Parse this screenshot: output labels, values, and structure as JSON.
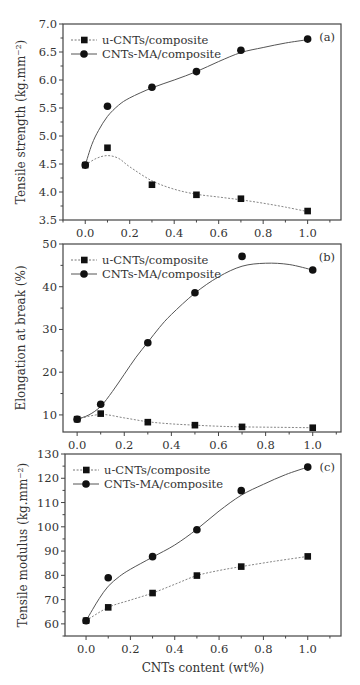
{
  "figure": {
    "width": 360,
    "height": 685
  },
  "chart_data": [
    {
      "type": "line",
      "panel_label": "(a)",
      "title": "",
      "xlabel": "",
      "ylabel": "Tensile strength (kg.mm⁻²)",
      "xlim": [
        -0.1,
        1.15
      ],
      "ylim": [
        3.5,
        7.0
      ],
      "xticks": [
        0.0,
        0.2,
        0.4,
        0.6,
        0.8,
        1.0
      ],
      "xtick_labels": [
        "0.0",
        "0.2",
        "0.4",
        "0.6",
        "0.8",
        "1.0"
      ],
      "yticks": [
        3.5,
        4.0,
        4.5,
        5.0,
        5.5,
        6.0,
        6.5,
        7.0
      ],
      "ytick_labels": [
        "3.5",
        "4.0",
        "4.5",
        "5.0",
        "5.5",
        "6.0",
        "6.5",
        "7.0"
      ],
      "grid": false,
      "legend_position": "upper left",
      "x": [
        0.0,
        0.1,
        0.3,
        0.5,
        0.7,
        1.0
      ],
      "series": [
        {
          "name": "u-CNTs/composite",
          "marker": "square",
          "line": "dashed",
          "values": [
            4.48,
            4.79,
            4.13,
            3.95,
            3.88,
            3.66
          ],
          "curve": [
            [
              0.0,
              4.48
            ],
            [
              0.05,
              4.6
            ],
            [
              0.1,
              4.65
            ],
            [
              0.15,
              4.6
            ],
            [
              0.2,
              4.45
            ],
            [
              0.3,
              4.2
            ],
            [
              0.4,
              4.05
            ],
            [
              0.5,
              3.96
            ],
            [
              0.6,
              3.91
            ],
            [
              0.7,
              3.86
            ],
            [
              0.8,
              3.8
            ],
            [
              0.9,
              3.73
            ],
            [
              1.0,
              3.65
            ]
          ]
        },
        {
          "name": "CNTs-MA/composite",
          "marker": "circle",
          "line": "solid",
          "values": [
            4.48,
            5.53,
            5.87,
            6.15,
            6.53,
            6.73
          ],
          "curve": [
            [
              0.0,
              4.48
            ],
            [
              0.03,
              4.85
            ],
            [
              0.06,
              5.1
            ],
            [
              0.1,
              5.35
            ],
            [
              0.15,
              5.55
            ],
            [
              0.2,
              5.68
            ],
            [
              0.3,
              5.86
            ],
            [
              0.4,
              6.0
            ],
            [
              0.5,
              6.15
            ],
            [
              0.6,
              6.33
            ],
            [
              0.7,
              6.49
            ],
            [
              0.8,
              6.58
            ],
            [
              0.9,
              6.66
            ],
            [
              1.0,
              6.72
            ]
          ]
        }
      ],
      "box": {
        "left": 63,
        "top": 24,
        "right": 341,
        "bottom": 220
      }
    },
    {
      "type": "line",
      "panel_label": "(b)",
      "title": "",
      "xlabel": "",
      "ylabel": "Elongation at break (%)",
      "xlim": [
        -0.06,
        1.12
      ],
      "ylim": [
        6,
        50
      ],
      "xticks": [
        0.0,
        0.2,
        0.4,
        0.6,
        0.8,
        1.0
      ],
      "xtick_labels": [
        "0.0",
        "0.2",
        "0.4",
        "0.6",
        "0.8",
        "1.0"
      ],
      "yticks": [
        10,
        20,
        30,
        40,
        50
      ],
      "ytick_labels": [
        "10",
        "20",
        "30",
        "40",
        "50"
      ],
      "grid": false,
      "legend_position": "upper left",
      "x": [
        0.0,
        0.1,
        0.3,
        0.5,
        0.7,
        1.0
      ],
      "series": [
        {
          "name": "u-CNTs/composite",
          "marker": "square",
          "line": "dashed",
          "values": [
            9.0,
            10.3,
            8.3,
            7.6,
            7.2,
            7.0
          ],
          "curve": [
            [
              0.0,
              9.0
            ],
            [
              0.1,
              10.1
            ],
            [
              0.2,
              9.3
            ],
            [
              0.3,
              8.4
            ],
            [
              0.4,
              7.9
            ],
            [
              0.5,
              7.6
            ],
            [
              0.6,
              7.35
            ],
            [
              0.7,
              7.2
            ],
            [
              0.85,
              7.1
            ],
            [
              1.0,
              7.0
            ]
          ]
        },
        {
          "name": "CNTs-MA/composite",
          "marker": "circle",
          "line": "solid",
          "values": [
            9.0,
            12.5,
            26.9,
            38.6,
            47.1,
            43.9
          ],
          "curve": [
            [
              0.0,
              9.0
            ],
            [
              0.05,
              10.0
            ],
            [
              0.1,
              12.0
            ],
            [
              0.15,
              15.5
            ],
            [
              0.2,
              19.5
            ],
            [
              0.25,
              23.5
            ],
            [
              0.3,
              27.0
            ],
            [
              0.35,
              30.5
            ],
            [
              0.4,
              33.5
            ],
            [
              0.5,
              38.5
            ],
            [
              0.6,
              42.3
            ],
            [
              0.7,
              44.8
            ],
            [
              0.8,
              45.5
            ],
            [
              0.9,
              45.2
            ],
            [
              1.0,
              43.9
            ]
          ]
        }
      ],
      "box": {
        "left": 63,
        "top": 244,
        "right": 341,
        "bottom": 432
      }
    },
    {
      "type": "line",
      "panel_label": "(c)",
      "title": "",
      "xlabel": "CNTs content (wt%)",
      "ylabel": "Tensile modulus (kg.mm⁻²)",
      "xlim": [
        -0.095,
        1.15
      ],
      "ylim": [
        55,
        130
      ],
      "xticks": [
        0.0,
        0.2,
        0.4,
        0.6,
        0.8,
        1.0
      ],
      "xtick_labels": [
        "0.0",
        "0.2",
        "0.4",
        "0.6",
        "0.8",
        "1.0"
      ],
      "yticks": [
        60,
        70,
        80,
        90,
        100,
        110,
        120,
        130
      ],
      "ytick_labels": [
        "60",
        "70",
        "80",
        "90",
        "100",
        "110",
        "120",
        "130"
      ],
      "grid": false,
      "legend_position": "upper left",
      "x": [
        0.0,
        0.1,
        0.3,
        0.5,
        0.7,
        1.0
      ],
      "series": [
        {
          "name": "u-CNTs/composite",
          "marker": "square",
          "line": "dashed",
          "values": [
            61.3,
            66.8,
            72.7,
            79.9,
            83.6,
            87.8
          ],
          "curve": [
            [
              0.0,
              61.3
            ],
            [
              0.1,
              66.8
            ],
            [
              0.2,
              69.8
            ],
            [
              0.3,
              72.7
            ],
            [
              0.4,
              76.3
            ],
            [
              0.5,
              79.9
            ],
            [
              0.6,
              82.0
            ],
            [
              0.7,
              83.6
            ],
            [
              0.85,
              85.8
            ],
            [
              1.0,
              87.8
            ]
          ]
        },
        {
          "name": "CNTs-MA/composite",
          "marker": "circle",
          "line": "solid",
          "values": [
            61.3,
            79.0,
            87.7,
            98.8,
            114.9,
            124.6
          ],
          "curve": [
            [
              0.0,
              61.3
            ],
            [
              0.03,
              66.0
            ],
            [
              0.06,
              70.5
            ],
            [
              0.1,
              75.5
            ],
            [
              0.15,
              79.5
            ],
            [
              0.2,
              82.5
            ],
            [
              0.3,
              87.5
            ],
            [
              0.4,
              92.5
            ],
            [
              0.5,
              99.0
            ],
            [
              0.6,
              106.5
            ],
            [
              0.7,
              113.0
            ],
            [
              0.8,
              117.5
            ],
            [
              0.9,
              121.5
            ],
            [
              1.0,
              124.6
            ]
          ]
        }
      ],
      "box": {
        "left": 65,
        "top": 454,
        "right": 341,
        "bottom": 636
      }
    }
  ]
}
